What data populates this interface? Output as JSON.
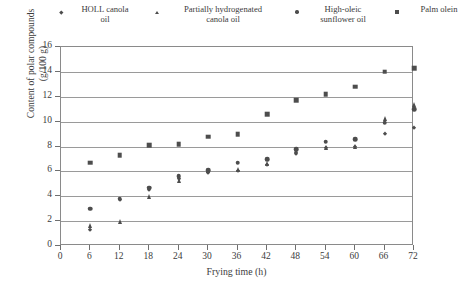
{
  "chart_data": {
    "type": "scatter",
    "title": "",
    "xlabel": "Frying time (h)",
    "ylabel": "Content of polar compounds\n(g/100 g)",
    "xlim": [
      0,
      72
    ],
    "ylim": [
      0,
      16
    ],
    "xticks": [
      0,
      6,
      12,
      18,
      24,
      30,
      36,
      42,
      48,
      54,
      60,
      66,
      72
    ],
    "yticks": [
      0,
      2,
      4,
      6,
      8,
      10,
      12,
      14,
      16
    ],
    "grid": "horizontal",
    "legend_position": "top",
    "x": [
      6,
      12,
      18,
      24,
      30,
      36,
      42,
      48,
      54,
      60,
      66,
      72
    ],
    "series": [
      {
        "name": "HOLL canola\noil",
        "marker": "diamond",
        "color": "#4d4d4d",
        "values": [
          1.3,
          3.7,
          4.5,
          5.4,
          5.9,
          6.0,
          6.5,
          7.4,
          7.9,
          8.0,
          9.0,
          9.5
        ]
      },
      {
        "name": "Partially hydrogenated\ncanola oil",
        "marker": "triangle",
        "color": "#4d4d4d",
        "values": [
          1.6,
          1.9,
          3.9,
          5.2,
          6.0,
          6.1,
          6.6,
          7.6,
          7.9,
          8.0,
          10.2,
          11.3
        ]
      },
      {
        "name": "High-oleic\nsunflower oil",
        "marker": "circle",
        "color": "#4d4d4d",
        "values": [
          3.0,
          3.8,
          4.7,
          5.6,
          6.1,
          6.7,
          7.0,
          7.8,
          8.4,
          8.6,
          9.9,
          11.0
        ]
      },
      {
        "name": "Palm olein",
        "marker": "square",
        "color": "#4d4d4d",
        "values": [
          6.7,
          7.3,
          8.1,
          8.2,
          8.8,
          9.0,
          10.6,
          11.7,
          12.2,
          12.8,
          14.0,
          14.3
        ]
      }
    ]
  },
  "legend": {
    "entries": [
      {
        "label": "HOLL canola\noil",
        "marker": "diamond"
      },
      {
        "label": "Partially hydrogenated\ncanola oil",
        "marker": "triangle"
      },
      {
        "label": "High-oleic\nsunflower oil",
        "marker": "circle"
      },
      {
        "label": "Palm olein",
        "marker": "square"
      }
    ]
  },
  "colors": {
    "marker": "#4d4d4d",
    "grid": "#9a9a9a",
    "axis": "#8a8a8a",
    "text": "#3b3b3b",
    "background": "#ffffff"
  }
}
